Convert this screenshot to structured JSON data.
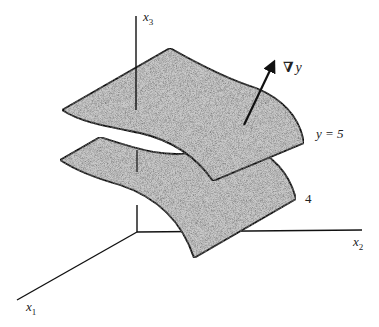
{
  "figure": {
    "colors": {
      "background": "#ffffff",
      "surface_fill": "#c9c9c9",
      "line": "#111111",
      "text": "#222222"
    },
    "axes": {
      "x1": {
        "label": "x",
        "subscript": "1"
      },
      "x2": {
        "label": "x",
        "subscript": "2"
      },
      "x3": {
        "label": "x",
        "subscript": "3"
      }
    },
    "surfaces": [
      {
        "name": "upper",
        "label": "y = 5"
      },
      {
        "name": "lower",
        "label": "4"
      }
    ],
    "gradient": {
      "symbol": "∇",
      "variable": "y"
    }
  }
}
